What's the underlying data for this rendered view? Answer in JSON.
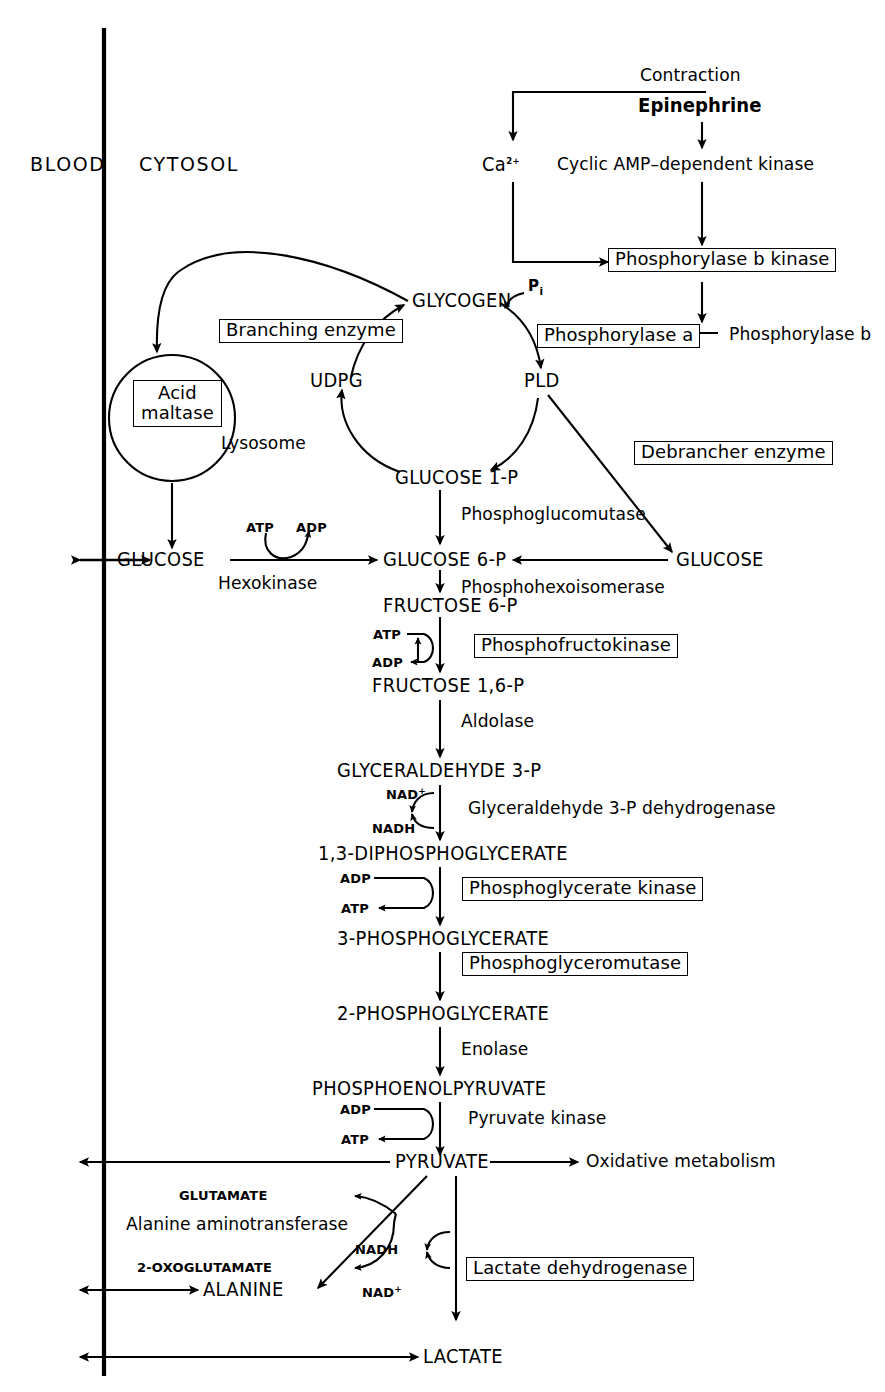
{
  "diagram": {
    "compartments": {
      "blood": "BLOOD",
      "cytosol": "CYTOSOL"
    },
    "regulation": {
      "contraction": "Contraction",
      "epinephrine": "Epinephrine",
      "calcium": "Ca",
      "calcium_charge": "2+",
      "camp_kinase": "Cyclic AMP–dependent kinase",
      "phosphorylase_b_kinase": "Phosphorylase b kinase",
      "phosphorylase_a": "Phosphorylase a",
      "phosphorylase_b": "Phosphorylase b"
    },
    "glycogen_cycle": {
      "glycogen": "GLYCOGEN",
      "udpg": "UDPG",
      "glucose_1_p": "GLUCOSE 1-P",
      "pld": "PLD",
      "pi": "P",
      "pi_sub": "i",
      "branching_enzyme": "Branching enzyme",
      "debrancher_enzyme": "Debrancher enzyme",
      "phosphoglucomutase": "Phosphoglucomutase"
    },
    "lysosome": {
      "label": "Lysosome",
      "acid_maltase_line1": "Acid",
      "acid_maltase_line2": "maltase"
    },
    "glycolysis": {
      "metabolites": [
        "GLUCOSE",
        "GLUCOSE 6-P",
        "FRUCTOSE 6-P",
        "FRUCTOSE 1,6-P",
        "GLYCERALDEHYDE 3-P",
        "1,3-DIPHOSPHOGLYCERATE",
        "3-PHOSPHOGLYCERATE",
        "2-PHOSPHOGLYCERATE",
        "PHOSPHOENOLPYRUVATE",
        "PYRUVATE"
      ],
      "enzymes_plain": [
        "Hexokinase",
        "Phosphohexoisomerase",
        "Aldolase",
        "Glyceraldehyde 3-P dehydrogenase",
        "Enolase",
        "Pyruvate kinase"
      ],
      "enzymes_boxed": [
        "Phosphofructokinase",
        "Phosphoglycerate kinase",
        "Phosphoglyceromutase"
      ],
      "free_glucose": "GLUCOSE"
    },
    "cofactors": {
      "atp": "ATP",
      "adp": "ADP",
      "nad": "NAD",
      "nad_charge": "+",
      "nadh": "NADH"
    },
    "outputs": {
      "oxidative_metabolism": "Oxidative metabolism",
      "alanine": "ALANINE",
      "lactate": "LACTATE",
      "glutamate": "GLUTAMATE",
      "oxoglutamate": "2-OXOGLUTAMATE",
      "alanine_aminotransferase": "Alanine  aminotransferase",
      "lactate_dehydrogenase": "Lactate dehydrogenase"
    },
    "colors": {
      "ink": "#000000",
      "paper": "#ffffff"
    }
  }
}
